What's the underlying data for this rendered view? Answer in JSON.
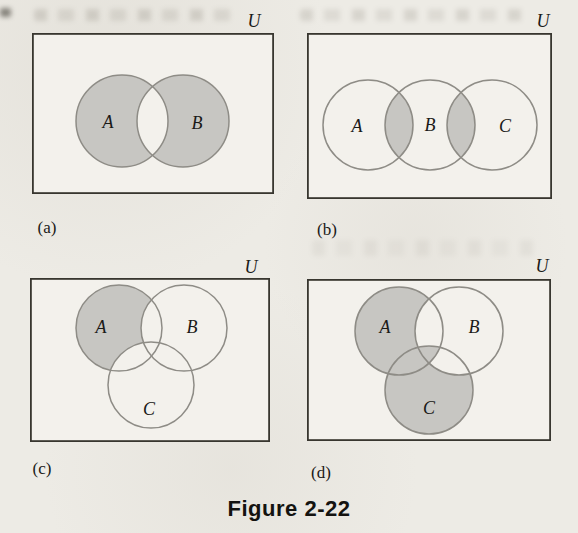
{
  "figure_caption": "Figure 2-22",
  "colors": {
    "page_background": "#edebe5",
    "panel_background": "#f3f1ec",
    "shaded_fill": "#c7c6c2",
    "circle_stroke": "#8e8c86",
    "rect_stroke": "#38362f",
    "text": "#1b1a18"
  },
  "panels": {
    "a": {
      "caption": "(a)",
      "universe_label": "U",
      "set_labels": {
        "A": "A",
        "B": "B"
      },
      "shaded_regions": [
        "A − B",
        "B − A"
      ],
      "description": "Two overlapping circles A and B inside universe rectangle U; both circles shaded gray except their intersection, which is unshaded (symmetric difference)"
    },
    "b": {
      "caption": "(b)",
      "universe_label": "U",
      "set_labels": {
        "A": "A",
        "B": "B",
        "C": "C"
      },
      "shaded_regions": [
        "A ∩ B",
        "B ∩ C"
      ],
      "description": "Three circles A, B, C in a row inside universe rectangle U; only the two pairwise intersection lenses A∩B and B∩C are shaded gray"
    },
    "c": {
      "caption": "(c)",
      "universe_label": "U",
      "set_labels": {
        "A": "A",
        "B": "B",
        "C": "C"
      },
      "shaded_regions": [
        "A − (B ∪ C)"
      ],
      "description": "Three mutually overlapping circles inside universe rectangle U; only the part of A outside both B and C is shaded gray"
    },
    "d": {
      "caption": "(d)",
      "universe_label": "U",
      "set_labels": {
        "A": "A",
        "B": "B",
        "C": "C"
      },
      "shaded_regions": [
        "A − (B ∪ C)",
        "(A ∩ C) − B",
        "A ∩ B ∩ C",
        "C − (A ∪ B)"
      ],
      "description": "Three mutually overlapping circles inside universe rectangle U; circles A and C are shaded gray except the regions (A∩B)−C and (B∩C)−A, which remain unshaded; the triple intersection is shaded"
    }
  }
}
